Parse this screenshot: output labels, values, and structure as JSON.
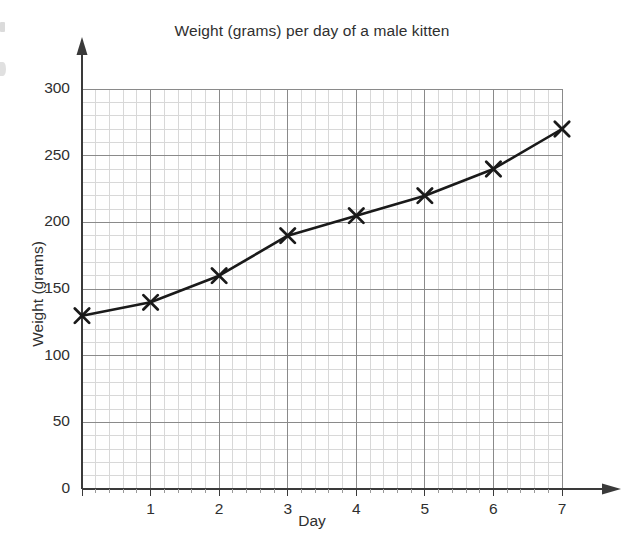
{
  "chart_data": {
    "type": "line",
    "title": "Weight (grams) per day of a male kitten",
    "xlabel": "Day",
    "ylabel": "Weight (grams)",
    "x": [
      0,
      1,
      2,
      3,
      4,
      5,
      6,
      7
    ],
    "values": [
      130,
      140,
      160,
      190,
      205,
      220,
      240,
      270
    ],
    "series": [
      {
        "name": "Kitten weight",
        "values": [
          130,
          140,
          160,
          190,
          205,
          220,
          240,
          270
        ]
      }
    ],
    "xlim": [
      0,
      7
    ],
    "ylim": [
      0,
      300
    ],
    "x_tick_labels": [
      "1",
      "2",
      "3",
      "4",
      "5",
      "6",
      "7"
    ],
    "x_tick_values": [
      1,
      2,
      3,
      4,
      5,
      6,
      7
    ],
    "y_tick_labels": [
      "0",
      "50",
      "100",
      "150",
      "200",
      "250",
      "300"
    ],
    "y_tick_values": [
      0,
      50,
      100,
      150,
      200,
      250,
      300
    ],
    "origin_label": "0",
    "grid": true,
    "minor_grid": true,
    "minor_divisions": 5,
    "legend": "none",
    "marker": "x-cross",
    "line_color": "#1a1a1a",
    "marker_color": "#1a1a1a",
    "grid_color": "#8a8a8a",
    "minor_grid_color": "#d8d8d8",
    "axis_color": "#3a3a3a",
    "text_color": "#2f2f2f",
    "background": "#ffffff",
    "x_axis_arrow": true,
    "y_axis_arrow": true
  }
}
